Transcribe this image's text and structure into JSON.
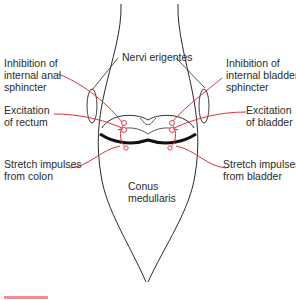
{
  "diagram": {
    "colors": {
      "outline": "#2a2a2a",
      "nerve": "#e0303c",
      "background": "#ffffff"
    },
    "labels": {
      "nervi_erigentes": "Nervi erigentes",
      "inhibition_anal": [
        "Inhibition of",
        "internal anal",
        "sphincter"
      ],
      "inhibition_bladder": [
        "Inhibition of",
        "internal bladder",
        "sphincter"
      ],
      "excitation_rectum": [
        "Excitation",
        "of rectum"
      ],
      "excitation_bladder": [
        "Excitation",
        "of bladder"
      ],
      "stretch_colon": [
        "Stretch impulses",
        "from colon"
      ],
      "stretch_bladder": [
        "Stretch impulses",
        "from bladder"
      ],
      "conus": [
        "Conus",
        "medullaris"
      ]
    }
  }
}
